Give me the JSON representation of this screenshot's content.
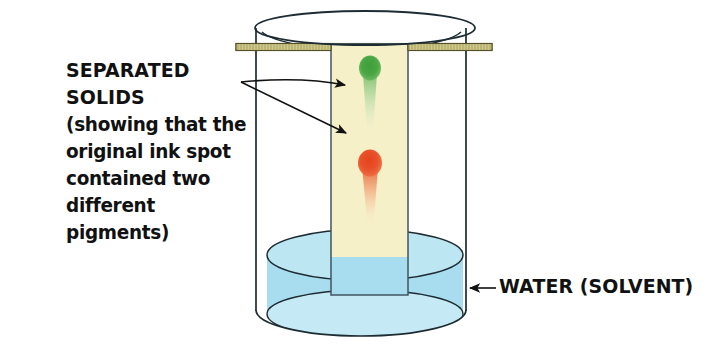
{
  "figure": {
    "background_color": "#ffffff"
  },
  "annotations": {
    "separated_solids": {
      "heading": "SEPARATED SOLIDS",
      "lines": [
        "(showing that the",
        "original ink spot",
        "contained two",
        "different pigments)"
      ],
      "arrow_count": 2
    },
    "water": {
      "label": "WATER (SOLVENT)",
      "arrow_count": 1
    }
  },
  "apparatus": {
    "beaker": {
      "name": "beaker",
      "outline_color": "#1d2b33",
      "fill_color": "#ffffff"
    },
    "support_rod": {
      "name": "support-rod",
      "fill_color": "#cfc98a",
      "edge_color": "#6d6836"
    },
    "paper_strip": {
      "name": "chromatography-paper-strip",
      "fill_color": "#f6f0c8",
      "submerged_fill_color": "#aadff0",
      "edge_color": "#3f5560"
    },
    "solvent": {
      "name": "solvent-water",
      "body_color": "#a8dcef",
      "surface_color": "#bde6f3",
      "surface_edge_color": "#1d2b33"
    }
  },
  "pigment_spots": [
    {
      "name": "green-pigment-spot",
      "color": "#4aa744",
      "tail_color": "#8fc98a",
      "position": "upper"
    },
    {
      "name": "orange-pigment-spot",
      "color": "#e8512a",
      "tail_color": "#f0a274",
      "position": "lower"
    }
  ]
}
